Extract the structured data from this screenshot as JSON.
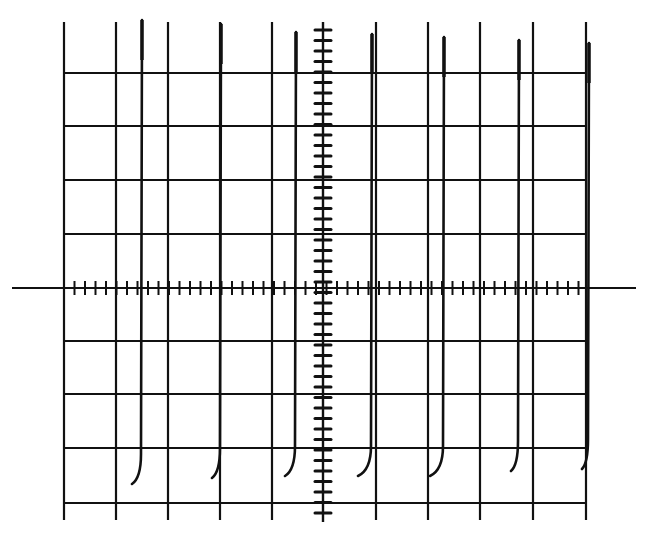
{
  "figure": {
    "colors": {
      "background": "#ffffff",
      "ink": "#111111"
    }
  },
  "graticule": {
    "vertical_lines_x": [
      64,
      116,
      168,
      220,
      272,
      376,
      428,
      480,
      533,
      586
    ],
    "center_x": 323,
    "horizontal_lines_y": [
      73,
      126,
      180,
      234,
      341,
      394,
      448,
      503
    ],
    "center_y": 288,
    "top_y": 20,
    "bottom_y": 520,
    "h_axis_extent": [
      12,
      636
    ],
    "v_axis_extent": [
      22,
      522
    ],
    "minor_tick_spacing": 10.5,
    "divisions_x": 10,
    "divisions_y": 9
  },
  "trace": {
    "spikes": [
      {
        "x": 142,
        "top": 20,
        "hook_end_x": 132,
        "hook_end_y": 484
      },
      {
        "x": 221,
        "top": 24,
        "hook_end_x": 212,
        "hook_end_y": 478
      },
      {
        "x": 296,
        "top": 32,
        "hook_end_x": 285,
        "hook_end_y": 476
      },
      {
        "x": 372,
        "top": 34,
        "hook_end_x": 358,
        "hook_end_y": 476
      },
      {
        "x": 444,
        "top": 37,
        "hook_end_x": 430,
        "hook_end_y": 476
      },
      {
        "x": 519,
        "top": 40,
        "hook_end_x": 511,
        "hook_end_y": 471
      },
      {
        "x": 589,
        "top": 43,
        "hook_end_x": 582,
        "hook_end_y": 469
      }
    ]
  }
}
